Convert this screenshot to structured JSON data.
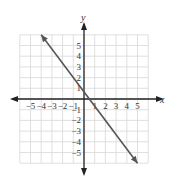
{
  "chart_data": {
    "type": "line",
    "title": "",
    "xlabel": "x",
    "ylabel": "y",
    "xlim": [
      -6,
      6
    ],
    "ylim": [
      -6,
      6
    ],
    "grid": true,
    "x_ticks": [
      "-5",
      "-4",
      "-3",
      "-2",
      "-1",
      "1",
      "2",
      "3",
      "4",
      "5"
    ],
    "y_ticks": [
      "5",
      "4",
      "3",
      "2",
      "1",
      "-1",
      "-2",
      "-3",
      "-4",
      "-5"
    ],
    "series": [
      {
        "name": "line",
        "equation": "y = -4/3 x + 2/3",
        "x": [
          -4,
          5
        ],
        "values": [
          6,
          -6
        ],
        "color": "#555555",
        "arrows": "both"
      }
    ]
  },
  "colors": {
    "grid": "#d8d8d8",
    "axis": "#222222",
    "line": "#555555"
  }
}
